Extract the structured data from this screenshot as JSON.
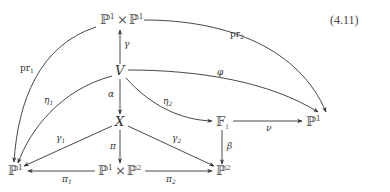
{
  "equation_number": "(4.11)",
  "nodes": {
    "p1xp1": {
      "base": "ℙ",
      "sup": "1",
      "times": "×",
      "base2": "ℙ",
      "sup2": "1"
    },
    "V": {
      "label": "V"
    },
    "X": {
      "label": "X"
    },
    "F1": {
      "base": "𝔽",
      "sub": "1"
    },
    "P1_right": {
      "base": "ℙ",
      "sup": "1"
    },
    "P1_left": {
      "base": "ℙ",
      "sup": "1"
    },
    "p1xp2": {
      "base": "ℙ",
      "sup": "1",
      "times": "×",
      "base2": "ℙ",
      "sup2": "2"
    },
    "P2": {
      "base": "ℙ",
      "sup": "2"
    }
  },
  "edges": {
    "pr1": {
      "base": "pr",
      "sub": "1",
      "from": "P¹×P¹",
      "to": "P¹ (left)"
    },
    "pr2": {
      "base": "pr",
      "sub": "2",
      "from": "P¹×P¹",
      "to": "P¹ (right)"
    },
    "gamma": {
      "label": "γ",
      "from": "V",
      "to": "P¹×P¹"
    },
    "phi": {
      "label": "φ",
      "from": "V",
      "to": "P¹ (right)"
    },
    "eta1": {
      "base": "η",
      "sub": "1",
      "from": "V",
      "to": "P¹ (left)"
    },
    "eta2": {
      "base": "η",
      "sub": "2",
      "from": "V",
      "to": "F₁"
    },
    "alpha": {
      "label": "α",
      "from": "V",
      "to": "X"
    },
    "nu": {
      "label": "ν",
      "from": "F₁",
      "to": "P¹ (right)"
    },
    "beta": {
      "label": "β",
      "from": "F₁",
      "to": "P²"
    },
    "gamma1": {
      "base": "γ",
      "sub": "1",
      "from": "X",
      "to": "P¹ (left)"
    },
    "gamma2": {
      "base": "γ",
      "sub": "2",
      "from": "X",
      "to": "P²"
    },
    "pi": {
      "label": "π",
      "from": "X",
      "to": "P¹×P²"
    },
    "pi1": {
      "base": "π",
      "sub": "1",
      "from": "P¹×P²",
      "to": "P¹ (left)"
    },
    "pi2": {
      "base": "π",
      "sub": "2",
      "from": "P¹×P²",
      "to": "P²"
    }
  }
}
